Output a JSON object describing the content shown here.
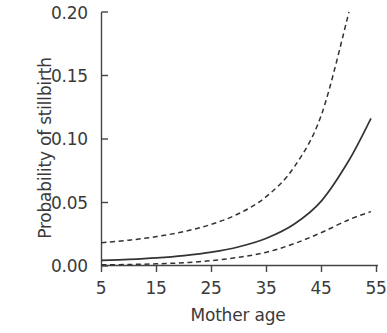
{
  "chart_data": {
    "type": "line",
    "title": "",
    "xlabel": "Mother age",
    "ylabel": "Probability of stillbirth",
    "xlim": [
      5,
      55
    ],
    "ylim": [
      0.0,
      0.2
    ],
    "grid": false,
    "legend": "none",
    "xticks": [
      5,
      15,
      25,
      35,
      45,
      55
    ],
    "xtick_labels": [
      "5",
      "15",
      "25",
      "35",
      "45",
      "55"
    ],
    "yticks": [
      0.0,
      0.05,
      0.1,
      0.15,
      0.2
    ],
    "ytick_labels": [
      "0.00",
      "0.05",
      "0.10",
      "0.15",
      "0.20"
    ],
    "x": [
      5,
      10,
      15,
      20,
      25,
      30,
      35,
      40,
      45,
      50,
      54
    ],
    "series": [
      {
        "name": "Predicted probability",
        "style": "solid",
        "color": "#333333",
        "values": [
          0.004,
          0.0048,
          0.006,
          0.0078,
          0.0105,
          0.0148,
          0.0215,
          0.0325,
          0.051,
          0.083,
          0.116
        ]
      },
      {
        "name": "Upper confidence limit",
        "style": "dashed",
        "color": "#333333",
        "values": [
          0.018,
          0.02,
          0.0228,
          0.0268,
          0.0325,
          0.041,
          0.0545,
          0.0775,
          0.119,
          0.2,
          0.2
        ]
      },
      {
        "name": "Lower confidence limit",
        "style": "dashed",
        "color": "#333333",
        "values": [
          0.0005,
          0.0008,
          0.0013,
          0.0022,
          0.0038,
          0.0065,
          0.0105,
          0.0172,
          0.026,
          0.0362,
          0.0425
        ]
      }
    ],
    "annotations": []
  },
  "axes": {
    "y_tick_labels": [
      "0.20",
      "0.15",
      "0.10",
      "0.05",
      "0.00"
    ],
    "x_tick_labels": [
      "5",
      "15",
      "25",
      "35",
      "45",
      "55"
    ],
    "y_axis_title": "Probability of stillbirth",
    "x_axis_title": "Mother age"
  },
  "colors": {
    "line": "#333333",
    "axis": "#444444",
    "text": "#3a3a3a",
    "background": "#ffffff"
  }
}
